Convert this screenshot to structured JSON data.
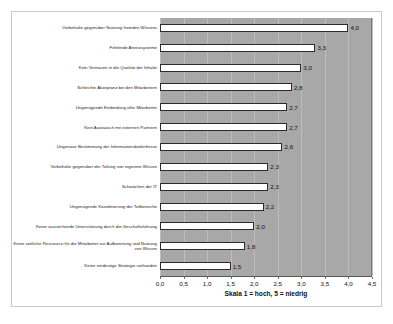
{
  "chart_data": {
    "type": "bar",
    "orientation": "horizontal",
    "title": "",
    "xlabel": "Skala 1 = hoch, 5 = niedrig",
    "ylabel": "",
    "xlim": [
      0.0,
      4.5
    ],
    "xtick_step": 0.5,
    "grid": true,
    "legend": false,
    "decimal_separator": ",",
    "categories": [
      "Vorbehalte gegenüber Nutzung fremden Wissens",
      "Fehlende Anreizsysteme",
      "Kein Vertrauen in die Qualität der Inhalte",
      "Schlechte Akzeptanz bei den Mitarbeitern",
      "Ungenügende Einbindung aller Mitarbeiter",
      "Kein Austausch mit externen Partnern",
      "Ungenaue Bestimmung der Informationsbedürfnisse",
      "Vorbehalte gegenüber der Teilung von eigenem Wissen",
      "Schwächen der IT",
      "Ungenügende Koordinierung der Teilbereiche",
      "Keine ausreichende Unterstützung durch die Geschäftsführung",
      "Keine zeitliche Ressource für die Mitarbeiter zur Aufbereitung und Nutzung von Wissen",
      "Keine eindeutige Strategie vorhanden"
    ],
    "values": [
      4.0,
      3.3,
      3.0,
      2.8,
      2.7,
      2.7,
      2.6,
      2.3,
      2.3,
      2.2,
      2.0,
      1.8,
      1.5
    ],
    "value_labels": [
      "4,0",
      "3,3",
      "3,0",
      "2,8",
      "2,7",
      "2,7",
      "2,6",
      "2,3",
      "2,3",
      "2,2",
      "2,0",
      "1,8",
      "1,5"
    ],
    "xtick_labels": [
      "0,0",
      "0,5",
      "1,0",
      "1,5",
      "2,0",
      "2,5",
      "3,0",
      "3,5",
      "4,0",
      "4,5"
    ],
    "xtick_values": [
      0.0,
      0.5,
      1.0,
      1.5,
      2.0,
      2.5,
      3.0,
      3.5,
      4.0,
      4.5
    ],
    "colors": {
      "plot_background": "#a8a8a8",
      "bar_fill": "#ffffff",
      "bar_border": "#2b2b2b",
      "gridline": "#bdbdbd",
      "frame_border": "#c9c9c9",
      "page_background": "#ffffff",
      "text": "#111111"
    }
  }
}
